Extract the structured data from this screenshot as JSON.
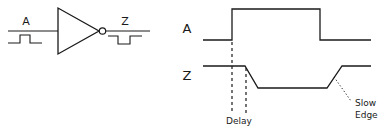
{
  "figure": {
    "ink_color": "#1a1a1a",
    "background_color": "#ffffff"
  },
  "symbol_panel": {
    "name": "inverter-symbol",
    "input_label": "A",
    "output_label": "Z",
    "input_pulse_polarity": "positive",
    "output_pulse_polarity": "negative",
    "has_inversion_bubble": true
  },
  "timing_panel": {
    "name": "timing-diagram",
    "waveforms": [
      {
        "name": "A",
        "label": "A",
        "kind": "ideal-square",
        "edges": "sharp"
      },
      {
        "name": "Z",
        "label": "Z",
        "kind": "delayed-inverted",
        "edges": "sloped"
      }
    ],
    "annotations": [
      {
        "name": "delay",
        "label": "Delay",
        "lines": [
          "Delay"
        ],
        "marker": "two-dashed-verticals"
      },
      {
        "name": "slow-edge",
        "label": "Slow Edge",
        "lines": [
          "Slow",
          "Edge"
        ],
        "marker": "dotted-leader"
      }
    ]
  }
}
